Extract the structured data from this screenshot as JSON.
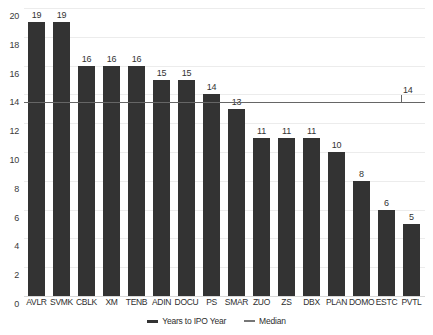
{
  "chart_data": {
    "type": "bar",
    "title": "",
    "subtitle": "",
    "xlabel": "",
    "ylabel": "",
    "ylim": [
      0,
      20
    ],
    "ytick_step": 2,
    "yticks": [
      "20",
      "18",
      "16",
      "14",
      "12",
      "10",
      "8",
      "6",
      "4",
      "2",
      "0"
    ],
    "grid": true,
    "legend_position": "bottom-center",
    "categories": [
      "AVLR",
      "SVMK",
      "CBLK",
      "XM",
      "TENB",
      "ADIN",
      "DOCU",
      "PS",
      "SMAR",
      "ZUO",
      "ZS",
      "DBX",
      "PLAN",
      "DOMO",
      "ESTC",
      "PVTL"
    ],
    "series": [
      {
        "name": "Years to IPO Year",
        "type": "bar",
        "color": "#333333",
        "values": [
          19,
          19,
          16,
          16,
          16,
          15,
          15,
          14,
          13,
          11,
          11,
          11,
          10,
          8,
          6,
          5
        ],
        "value_labels": [
          "19",
          "19",
          "16",
          "16",
          "16",
          "15",
          "15",
          "14",
          "13",
          "11",
          "11",
          "11",
          "10",
          "8",
          "6",
          "5"
        ]
      },
      {
        "name": "Median",
        "type": "line",
        "color": "#666666",
        "value": 13.5,
        "label": "14"
      }
    ]
  },
  "legend": {
    "items": [
      {
        "label": "Years to IPO Year",
        "swatch": "series-line-swatch"
      },
      {
        "label": "Median",
        "swatch": "median-line-swatch"
      }
    ]
  }
}
